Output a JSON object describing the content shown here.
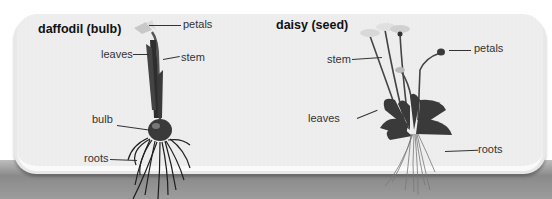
{
  "figure": {
    "left": {
      "title": "daffodil (bulb)",
      "labels": {
        "petals": "petals",
        "leaves": "leaves",
        "stem": "stem",
        "bulb": "bulb",
        "roots": "roots"
      }
    },
    "right": {
      "title": "daisy (seed)",
      "labels": {
        "stem": "stem",
        "petals": "petals",
        "leaves": "leaves",
        "roots": "roots"
      }
    },
    "colors": {
      "panel": "#eeeeee",
      "band": "#8a8a8a",
      "plant": "#2a2a2a",
      "text": "#333333"
    }
  }
}
